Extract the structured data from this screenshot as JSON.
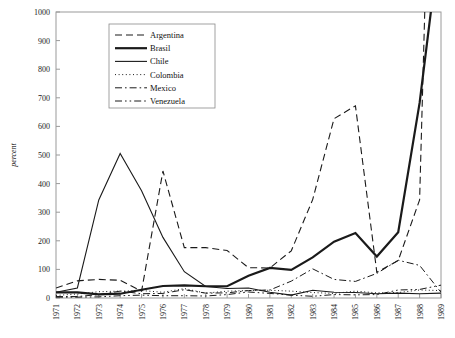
{
  "chart_data": {
    "type": "line",
    "title": "",
    "xlabel": "",
    "ylabel": "percent",
    "xlim": [
      1971,
      1989
    ],
    "ylim": [
      0,
      1000
    ],
    "ytick_step": 100,
    "grid": false,
    "legend_position": "top-left-inside",
    "yticks": [
      "0",
      "100",
      "200",
      "300",
      "400",
      "500",
      "600",
      "700",
      "800",
      "900",
      "1000"
    ],
    "categories": [
      1971,
      1972,
      1973,
      1974,
      1975,
      1976,
      1977,
      1978,
      1979,
      1980,
      1981,
      1982,
      1983,
      1984,
      1985,
      1986,
      1987,
      1988,
      1989
    ],
    "series": [
      {
        "name": "Argentina",
        "style": "dashed",
        "width": 1.1,
        "values": [
          35,
          60,
          65,
          62,
          24,
          444,
          176,
          176,
          166,
          106,
          105,
          165,
          344,
          627,
          672,
          90,
          131,
          343,
          3080
        ]
      },
      {
        "name": "Brasil",
        "style": "solid-thick",
        "width": 2.2,
        "values": [
          20,
          20,
          13,
          15,
          29,
          42,
          44,
          41,
          41,
          78,
          105,
          98,
          142,
          197,
          227,
          145,
          230,
          682,
          1287
        ]
      },
      {
        "name": "Chile",
        "style": "solid",
        "width": 1.1,
        "values": [
          20,
          35,
          343,
          505,
          375,
          212,
          92,
          40,
          33,
          35,
          20,
          10,
          27,
          20,
          19,
          15,
          17,
          15,
          17
        ]
      },
      {
        "name": "Colombia",
        "style": "dotted",
        "width": 1.0,
        "values": [
          9,
          14,
          22,
          24,
          26,
          20,
          33,
          17,
          24,
          26,
          27,
          24,
          19,
          16,
          24,
          18,
          19,
          28,
          26
        ]
      },
      {
        "name": "Mexico",
        "style": "dash-dot",
        "width": 1.0,
        "values": [
          5,
          5,
          12,
          24,
          15,
          16,
          29,
          17,
          18,
          26,
          28,
          59,
          102,
          65,
          58,
          86,
          132,
          114,
          20
        ]
      },
      {
        "name": "Venezuela",
        "style": "dash-dot-dot",
        "width": 1.0,
        "values": [
          3,
          3,
          4,
          8,
          10,
          8,
          8,
          7,
          12,
          21,
          16,
          10,
          6,
          12,
          11,
          12,
          28,
          30,
          45
        ]
      }
    ]
  },
  "legend": {
    "entries": [
      {
        "label": "Argentina",
        "style": "dashed"
      },
      {
        "label": "Brasil",
        "style": "solid-thick"
      },
      {
        "label": "Chile",
        "style": "solid"
      },
      {
        "label": "Colombia",
        "style": "dotted"
      },
      {
        "label": "Mexico",
        "style": "dash-dot"
      },
      {
        "label": "Venezuela",
        "style": "dash-dot-dot"
      }
    ]
  }
}
